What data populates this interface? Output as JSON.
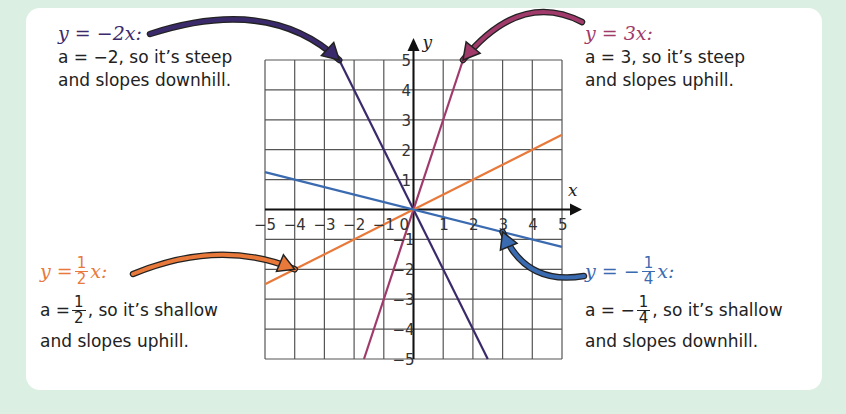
{
  "colors": {
    "background": "#dcefe3",
    "card": "#ffffff",
    "grid": "#555555",
    "axis": "#111111",
    "neg2": "#3b2a6b",
    "pos3": "#a03a6a",
    "half": "#e8793a",
    "negquarter": "#3a6ab0"
  },
  "annotations": {
    "neg2": {
      "equation_lhs": "y = −2x:",
      "line1": "a = −2, so it’s steep",
      "line2": "and slopes downhill."
    },
    "pos3": {
      "equation_lhs": "y = 3x:",
      "line1": "a = 3, so it’s steep",
      "line2": "and slopes uphill."
    },
    "half": {
      "eq_prefix": "y =",
      "eq_num": "1",
      "eq_den": "2",
      "eq_suffix": "x:",
      "desc_prefix": "a =",
      "desc_num": "1",
      "desc_den": "2",
      "desc_suffix": ", so it’s shallow",
      "line2": "and slopes uphill."
    },
    "negquarter": {
      "eq_prefix": "y = −",
      "eq_num": "1",
      "eq_den": "4",
      "eq_suffix": "x:",
      "desc_prefix": "a = −",
      "desc_num": "1",
      "desc_den": "4",
      "desc_suffix": ", so it’s shallow",
      "line2": "and slopes downhill."
    }
  },
  "chart_data": {
    "type": "line",
    "title": "",
    "xlabel": "x",
    "ylabel": "y",
    "xlim": [
      -5,
      5
    ],
    "ylim": [
      -5,
      5
    ],
    "grid": true,
    "x_ticks": [
      "−5",
      "−4",
      "−3",
      "−2",
      "−1",
      "0",
      "1",
      "2",
      "3",
      "4",
      "5"
    ],
    "y_ticks": [
      "−5",
      "−4",
      "−3",
      "−2",
      "−1",
      "1",
      "2",
      "3",
      "4",
      "5"
    ],
    "series": [
      {
        "name": "y = −2x",
        "slope": -2,
        "key": "neg2",
        "arrow_target": [
          -2.5,
          5
        ]
      },
      {
        "name": "y = 3x",
        "slope": 3,
        "key": "pos3",
        "arrow_target": [
          1.667,
          5
        ]
      },
      {
        "name": "y = 1/2 x",
        "slope": 0.5,
        "key": "half",
        "arrow_target": [
          -4,
          -2
        ]
      },
      {
        "name": "y = −1/4 x",
        "slope": -0.25,
        "key": "negquarter",
        "arrow_target": [
          3,
          -0.75
        ]
      }
    ]
  }
}
